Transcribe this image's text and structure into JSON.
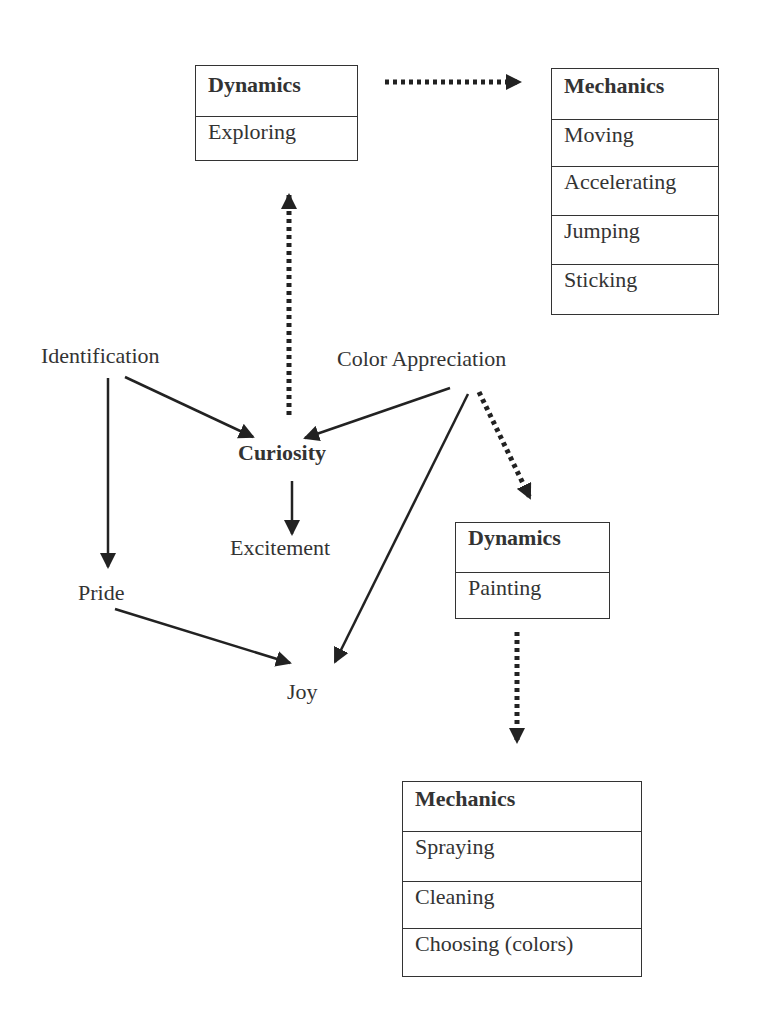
{
  "boxes": {
    "dyn_exploring": {
      "header": "Dynamics",
      "items": [
        "Exploring"
      ]
    },
    "mech_top": {
      "header": "Mechanics",
      "items": [
        "Moving",
        "Accelerating",
        "Jumping",
        "Sticking"
      ]
    },
    "dyn_painting": {
      "header": "Dynamics",
      "items": [
        "Painting"
      ]
    },
    "mech_bottom": {
      "header": "Mechanics",
      "items": [
        "Spraying",
        "Cleaning",
        "Choosing (colors)"
      ]
    }
  },
  "nodes": {
    "identification": "Identification",
    "color_appreciation": "Color Appreciation",
    "curiosity": "Curiosity",
    "excitement": "Excitement",
    "pride": "Pride",
    "joy": "Joy"
  },
  "edges": [
    {
      "from": "Dynamics: Exploring",
      "to": "Mechanics: Moving/Accelerating/Jumping/Sticking",
      "style": "dotted"
    },
    {
      "from": "Curiosity",
      "to": "Dynamics: Exploring",
      "style": "dotted"
    },
    {
      "from": "Identification",
      "to": "Curiosity",
      "style": "solid"
    },
    {
      "from": "Identification",
      "to": "Pride",
      "style": "solid"
    },
    {
      "from": "Color Appreciation",
      "to": "Curiosity",
      "style": "solid"
    },
    {
      "from": "Color Appreciation",
      "to": "Joy",
      "style": "solid"
    },
    {
      "from": "Color Appreciation",
      "to": "Dynamics: Painting",
      "style": "dotted"
    },
    {
      "from": "Curiosity",
      "to": "Excitement",
      "style": "solid"
    },
    {
      "from": "Pride",
      "to": "Joy",
      "style": "solid"
    },
    {
      "from": "Dynamics: Painting",
      "to": "Mechanics: Spraying/Cleaning/Choosing",
      "style": "dotted"
    }
  ]
}
